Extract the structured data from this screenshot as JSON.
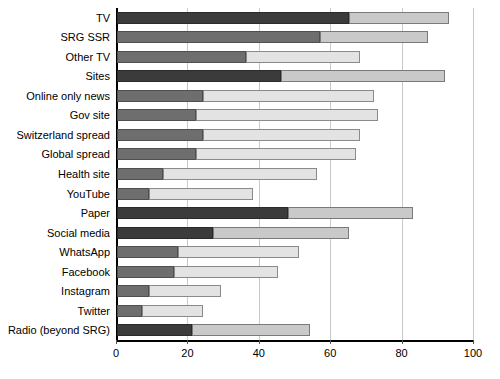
{
  "chart_data": {
    "type": "bar",
    "orientation": "horizontal",
    "stacked": true,
    "title": "",
    "xlabel": "",
    "ylabel": "",
    "xlim": [
      0,
      100
    ],
    "xticks": [
      0,
      20,
      40,
      60,
      80,
      100
    ],
    "grid": true,
    "legend": null,
    "categories": [
      "TV",
      "SRG SSR",
      "Other TV",
      "Sites",
      "Online only news",
      "Gov site",
      "Switzerland spread",
      "Global spread",
      "Health site",
      "YouTube",
      "Paper",
      "Social media",
      "WhatsApp",
      "Facebook",
      "Instagram",
      "Twitter",
      "Radio (beyond SRG)"
    ],
    "series": [
      {
        "name": "dark-segment",
        "color": "#3b3b3b",
        "values": [
          65,
          57,
          36,
          46,
          24,
          22,
          24,
          22,
          13,
          9,
          48,
          27,
          17,
          16,
          9,
          7,
          21
        ]
      },
      {
        "name": "light-segment",
        "color": "#c9c9c9",
        "values": [
          28,
          30,
          32,
          46,
          48,
          51,
          44,
          45,
          43,
          29,
          35,
          38,
          34,
          29,
          20,
          17,
          33
        ]
      }
    ],
    "totals": [
      93,
      87,
      68,
      92,
      72,
      73,
      68,
      67,
      56,
      38,
      83,
      65,
      51,
      45,
      29,
      24,
      54
    ],
    "shade_variants": {
      "dark_strong_rows": [
        0,
        3,
        10,
        11,
        16
      ],
      "light_pale_rows": [
        2,
        4,
        5,
        6,
        7,
        8,
        9,
        12,
        13,
        14,
        15
      ]
    }
  },
  "axis": {
    "tick_labels": [
      "0",
      "20",
      "40",
      "60",
      "80",
      "100"
    ]
  }
}
